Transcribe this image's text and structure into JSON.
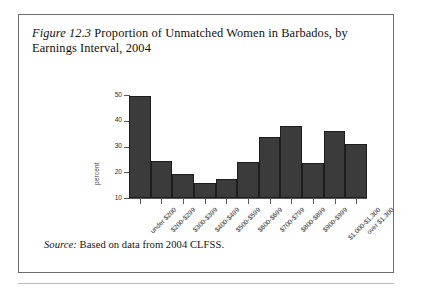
{
  "figure": {
    "label": "Figure 12.3",
    "caption": " Proportion of Unmatched Women in Barbados, by Earnings Interval, 2004",
    "source_label": "Source:",
    "source_text": " Based on data from 2004 CLFSS."
  },
  "colors": {
    "bar_fill": "#3b3b3b",
    "bar_stroke": "#1d1d1d",
    "axis": "#5a5a5a",
    "frame": "#6e6e6e",
    "text": "#121212"
  },
  "chart_data": {
    "type": "bar",
    "title": "",
    "xlabel": "",
    "ylabel": "percent",
    "ylim": [
      10,
      50
    ],
    "yticks": [
      10,
      20,
      30,
      40,
      50
    ],
    "grid": false,
    "legend": "none",
    "categories": [
      "under $200",
      "$200-$299",
      "$300-$399",
      "$400-$499",
      "$500-$599",
      "$600-$699",
      "$700-$799",
      "$800-$899",
      "$900-$999",
      "$1,000-$1,300",
      "over $1,300"
    ],
    "values": [
      49.5,
      24.5,
      19.5,
      16,
      17.5,
      24,
      33.5,
      38,
      23.5,
      36,
      31
    ]
  }
}
